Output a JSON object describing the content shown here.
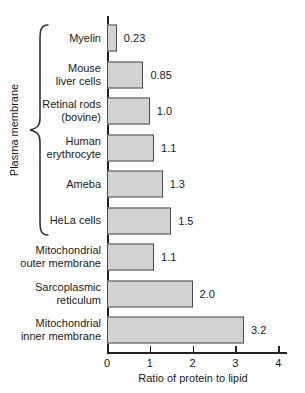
{
  "chart_data": {
    "type": "bar",
    "orientation": "horizontal",
    "title": "",
    "xlabel": "Ratio of protein to lipid",
    "ylabel": "",
    "xlim": [
      0,
      4
    ],
    "x_ticks": [
      "0",
      "1",
      "2",
      "3",
      "4"
    ],
    "grid": false,
    "legend": "none",
    "bar_fill": "#d2d2d2",
    "bar_border": "#4a4a4a",
    "categories": [
      "Myelin",
      "Mouse\nliver cells",
      "Retinal rods\n(bovine)",
      "Human\nerythrocyte",
      "Ameba",
      "HeLa cells",
      "Mitochondrial\nouter membrane",
      "Sarcoplasmic\nreticulum",
      "Mitochondrial\ninner membrane"
    ],
    "values": [
      0.23,
      0.85,
      1.0,
      1.1,
      1.3,
      1.5,
      1.1,
      2.0,
      3.2
    ],
    "value_labels": [
      "0.23",
      "0.85",
      "1.0",
      "1.1",
      "1.3",
      "1.5",
      "1.1",
      "2.0",
      "3.2"
    ],
    "bracket": {
      "label": "Plasma membrane",
      "row_start": 0,
      "row_end": 5
    }
  }
}
